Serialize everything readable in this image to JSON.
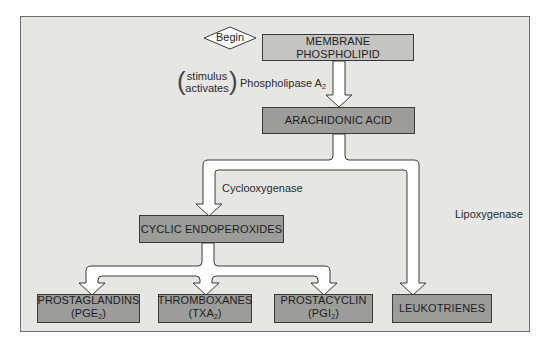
{
  "diagram": {
    "start": {
      "label": "Begin"
    },
    "nodes": {
      "membrane": {
        "label": "MEMBRANE PHOSPHOLIPID"
      },
      "arachidonic": {
        "label": "ARACHIDONIC ACID"
      },
      "cyclic": {
        "label": "CYCLIC ENDOPEROXIDES"
      },
      "prostaglandins": {
        "label": "PROSTAGLANDINS",
        "abbr_open": "(PGE",
        "abbr_sub": "2",
        "abbr_close": ")"
      },
      "thromboxanes": {
        "label": "THROMBOXANES",
        "abbr_open": "(TXA",
        "abbr_sub": "2",
        "abbr_close": ")"
      },
      "prostacyclin": {
        "label": "PROSTACYCLIN",
        "abbr_open": "(PGI",
        "abbr_sub": "2",
        "abbr_close": ")"
      },
      "leukotrienes": {
        "label": "LEUKOTRIENES"
      }
    },
    "edge_labels": {
      "stimulus_line1": "stimulus",
      "stimulus_line2": "activates",
      "paren_open": "(",
      "paren_close": ")",
      "phospholipase": "Phospholipase A",
      "phospholipase_sub": "2",
      "cyclooxygenase": "Cyclooxygenase",
      "lipoxygenase": "Lipoxygenase"
    },
    "colors": {
      "panel": "#e6e6e4",
      "light_box": "#c4c4c2",
      "dark_box": "#9c9c9a",
      "arrow_fill": "#ffffff",
      "stroke": "#3a3a3a"
    }
  }
}
